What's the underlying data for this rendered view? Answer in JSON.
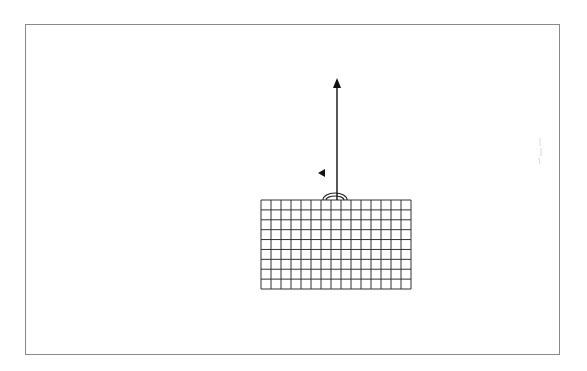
{
  "diagram": {
    "frame": {
      "x": 25,
      "y": 24,
      "width": 535,
      "height": 331,
      "border_color": "#8a8a8a"
    },
    "grid": {
      "x": 261,
      "y": 200,
      "width": 150,
      "height": 89,
      "columns": 15,
      "rows": 9,
      "line_color": "#333333"
    },
    "vector_arrow": {
      "x": 337,
      "y_start": 200,
      "y_end": 78,
      "color": "#111111",
      "direction": "up"
    },
    "dome": {
      "cx": 335,
      "cy": 200,
      "rx": 12,
      "ry": 7,
      "color": "#222222"
    },
    "pointer_triangle": {
      "x": 322,
      "y": 173,
      "direction": "left",
      "color": "#111111"
    },
    "faint_marks": {
      "x": 540,
      "y": 150,
      "color": "#d8d8d8"
    }
  }
}
